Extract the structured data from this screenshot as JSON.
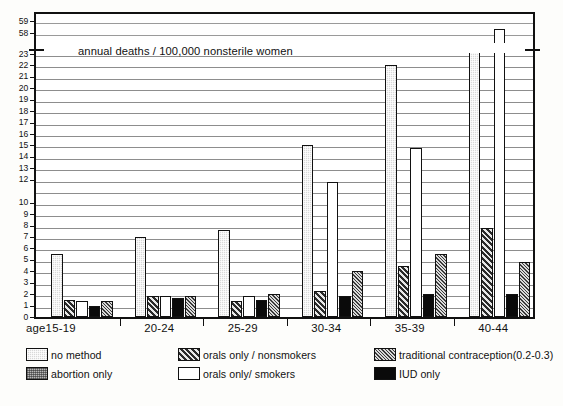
{
  "chart_data": {
    "type": "bar",
    "title": "annual deaths / 100,000    nonsterile women",
    "title_parts": {
      "left": "annual deaths / 100,000",
      "right": "nonsterile women"
    },
    "xlabel": "age",
    "ylabel": "",
    "categories": [
      "15-19",
      "20-24",
      "25-29",
      "30-34",
      "35-39",
      "40-44"
    ],
    "grid": true,
    "legend_position": "bottom",
    "axis_break": {
      "lower_range": [
        0,
        23
      ],
      "upper_range": [
        57.5,
        59.6
      ],
      "upper_ticks": [
        58,
        59
      ]
    },
    "ylim": [
      0,
      23
    ],
    "ytick_labels": [
      "0",
      "1",
      "2",
      "3",
      "4",
      "5",
      "6",
      "7",
      "8",
      "9",
      "10",
      "12",
      "13",
      "14",
      "15",
      "16",
      "17",
      "18",
      "19",
      "20",
      "21",
      "22",
      "23",
      "58",
      "59"
    ],
    "series": [
      {
        "name": "no method",
        "key": "nomethod",
        "values": [
          5.5,
          7.0,
          7.6,
          15.0,
          22.0,
          23.5
        ]
      },
      {
        "name": "orals only / nonsmokers",
        "key": "nonsmokers",
        "values": [
          1.5,
          1.8,
          1.4,
          2.3,
          4.5,
          7.8
        ]
      },
      {
        "name": "orals only / smokers",
        "key": "smokers",
        "values": [
          1.4,
          1.8,
          1.8,
          11.8,
          14.8,
          58.5
        ]
      },
      {
        "name": "IUD   only",
        "key": "iud",
        "values": [
          1.0,
          1.7,
          1.5,
          1.8,
          2.0,
          2.0
        ]
      },
      {
        "name": "traditional contraception(0.2-0.3)",
        "key": "traditional",
        "values": [
          1.4,
          1.8,
          2.0,
          4.0,
          5.5,
          4.8
        ]
      }
    ],
    "annotations": [
      "tallest bar (40-44, orals only / smokers) extends through the broken axis to 58.5"
    ]
  },
  "legend": {
    "entries": [
      {
        "label": "no method",
        "key": "nomethod"
      },
      {
        "label": "orals only / nonsmokers",
        "key": "nonsmokers"
      },
      {
        "label": "traditional contraception(0.2-0.3)",
        "key": "traditional"
      },
      {
        "label": "abortion only",
        "key": "abortion"
      },
      {
        "label": "orals only/ smokers",
        "key": "smokers"
      },
      {
        "label": "IUD   only",
        "key": "iud"
      }
    ]
  },
  "caption": "",
  "colors": {
    "axis": "#111111",
    "grid": "#8d8d8d",
    "no_method": "#d8d8d8",
    "abortion_only": "#b9b9b9",
    "orals_nonsmokers": "#8a8a8a",
    "orals_smokers": "#ffffff",
    "traditional": "#9b9b9b",
    "iud": "#0a0a0a"
  }
}
